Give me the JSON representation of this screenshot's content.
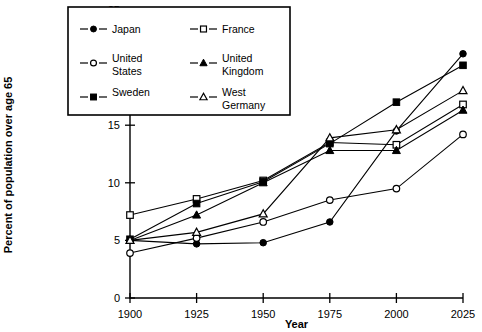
{
  "chart_data": {
    "type": "line",
    "title": "",
    "xlabel": "Year",
    "ylabel": "Percent of population over age 65",
    "x": [
      1900,
      1925,
      1950,
      1975,
      2000,
      2025
    ],
    "xticklabels": [
      "1900",
      "1925",
      "1950",
      "1975",
      "2000",
      "2025"
    ],
    "yticks": [
      0,
      5,
      10,
      15,
      20,
      25
    ],
    "yticklabels": [
      "0",
      "5",
      "10",
      "15",
      "20",
      "25"
    ],
    "xlim": [
      1900,
      2025
    ],
    "ylim": [
      0,
      25
    ],
    "grid": false,
    "legend_position": "upper-left-inset",
    "series": [
      {
        "name": "Japan",
        "marker": "filled-circle",
        "values": [
          5.0,
          4.7,
          4.8,
          6.6,
          14.5,
          21.2
        ]
      },
      {
        "name": "France",
        "marker": "open-square",
        "values": [
          7.2,
          8.6,
          10.2,
          13.5,
          13.3,
          16.8
        ]
      },
      {
        "name": "United States",
        "marker": "open-circle",
        "values": [
          3.9,
          5.2,
          6.6,
          8.5,
          9.5,
          14.2
        ]
      },
      {
        "name": "United Kingdom",
        "marker": "filled-triangle",
        "values": [
          5.0,
          7.2,
          10.0,
          12.8,
          12.8,
          16.3
        ]
      },
      {
        "name": "Sweden",
        "marker": "filled-square",
        "values": [
          5.1,
          8.2,
          10.1,
          13.4,
          17.0,
          20.2
        ]
      },
      {
        "name": "West Germany",
        "marker": "open-triangle",
        "values": [
          5.0,
          5.7,
          7.3,
          13.9,
          14.6,
          18.0
        ]
      }
    ]
  },
  "legend": {
    "entries": [
      {
        "label": "Japan",
        "marker": "filled-circle"
      },
      {
        "label": "France",
        "marker": "open-square"
      },
      {
        "label": "United States",
        "marker": "open-circle"
      },
      {
        "label": "United Kingdom",
        "marker": "filled-triangle"
      },
      {
        "label": "Sweden",
        "marker": "filled-square"
      },
      {
        "label": "West Germany",
        "marker": "open-triangle"
      }
    ],
    "labels_split": {
      "united_states_line1": "United",
      "united_states_line2": "States",
      "united_kingdom_line1": "United",
      "united_kingdom_line2": "Kingdom",
      "west_germany_line1": "West",
      "west_germany_line2": "Germany"
    }
  },
  "colors": {
    "ink": "#000000",
    "background": "#ffffff"
  }
}
